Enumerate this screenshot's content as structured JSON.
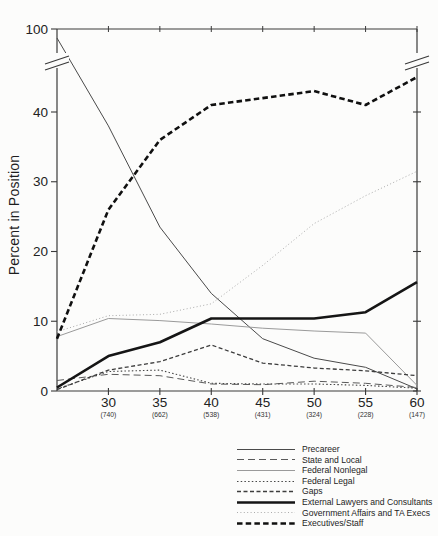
{
  "figure": {
    "y_axis_title": "Percent in Position"
  },
  "chart_data": {
    "type": "line",
    "title": "",
    "xlabel": "",
    "ylabel": "Percent in Position",
    "x_ages": [
      25,
      30,
      35,
      40,
      45,
      50,
      55,
      60
    ],
    "x_ticks": [
      {
        "label": "30",
        "count": "(740)"
      },
      {
        "label": "35",
        "count": "(662)"
      },
      {
        "label": "40",
        "count": "(538)"
      },
      {
        "label": "45",
        "count": "(431)"
      },
      {
        "label": "50",
        "count": "(324)"
      },
      {
        "label": "55",
        "count": "(228)"
      },
      {
        "label": "60",
        "count": "(147)"
      }
    ],
    "y_ticks": [
      0,
      10,
      20,
      30,
      40
    ],
    "y_top_tick_label": "100",
    "y_axis_break": {
      "present": true,
      "between": [
        45,
        100
      ]
    },
    "ylim_lower_segment": [
      0,
      45
    ],
    "grid": false,
    "legend_position": "bottom-right",
    "series": [
      {
        "label": "Precareer",
        "values": [
          97,
          38,
          23.5,
          14,
          7.5,
          4.7,
          3.4,
          0.3
        ],
        "color": "#4a4a4a",
        "width": 1,
        "dash": ""
      },
      {
        "label": "State and Local",
        "values": [
          1.5,
          2.4,
          2.2,
          1.0,
          0.9,
          1.4,
          1.1,
          0.5
        ],
        "color": "#5a5a5a",
        "width": 1,
        "dash": "7,4"
      },
      {
        "label": "Federal Nonlegal",
        "values": [
          7.8,
          10.4,
          10.1,
          9.6,
          9.0,
          8.6,
          8.3,
          0.8
        ],
        "color": "#9a9a9a",
        "width": 1,
        "dash": ""
      },
      {
        "label": "Federal Legal",
        "values": [
          0.3,
          2.8,
          3.0,
          1.1,
          1.0,
          1.0,
          0.8,
          0.4
        ],
        "color": "#474747",
        "width": 1.1,
        "dash": "1.5,2.2"
      },
      {
        "label": "Gaps",
        "values": [
          0.2,
          3.0,
          4.2,
          6.6,
          4.0,
          3.3,
          2.9,
          2.2
        ],
        "color": "#3d3d3d",
        "width": 1.3,
        "dash": "4,2.5"
      },
      {
        "label": "External Lawyers and Consultants",
        "values": [
          0.5,
          5.0,
          7.0,
          10.4,
          10.4,
          10.4,
          11.3,
          15.6
        ],
        "color": "#151515",
        "width": 2.6,
        "dash": ""
      },
      {
        "label": "Government Affairs and TA Execs",
        "values": [
          8.5,
          10.8,
          11.0,
          12.5,
          18.0,
          24.0,
          28.0,
          31.5
        ],
        "color": "#ababab",
        "width": 1,
        "dash": "1,2.4"
      },
      {
        "label": "Executives/Staff",
        "values": [
          7.5,
          26,
          36,
          41,
          42,
          43,
          41,
          45
        ],
        "color": "#101010",
        "width": 2.6,
        "dash": "5.5,3.2"
      }
    ]
  }
}
